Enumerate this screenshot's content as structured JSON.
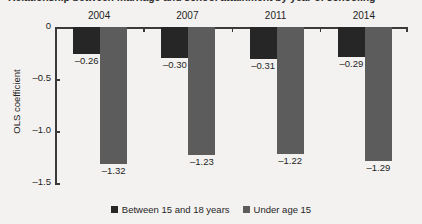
{
  "chart_data": {
    "type": "bar",
    "title": "Relationship between marriage and school attainment by year of schooling",
    "xlabel": "",
    "ylabel": "OLS coefficient",
    "categories": [
      "2004",
      "2007",
      "2011",
      "2014"
    ],
    "series": [
      {
        "name": "Between 15 and 18 years",
        "color": "#262626",
        "values": [
          -0.26,
          -0.3,
          -0.31,
          -0.29
        ],
        "labels": [
          "–0.26",
          "–0.30",
          "–0.31",
          "–0.29"
        ]
      },
      {
        "name": "Under age 15",
        "color": "#5c5c5c",
        "values": [
          -1.32,
          -1.23,
          -1.22,
          -1.29
        ],
        "labels": [
          "–1.32",
          "–1.23",
          "–1.22",
          "–1.29"
        ]
      }
    ],
    "ylim": [
      -1.5,
      0
    ],
    "yticks": [
      0,
      -0.5,
      -1.0,
      -1.5
    ],
    "ytick_labels": [
      "0",
      "–0.5",
      "–1.0",
      "–1.5"
    ],
    "grid": false,
    "legend_position": "bottom"
  }
}
